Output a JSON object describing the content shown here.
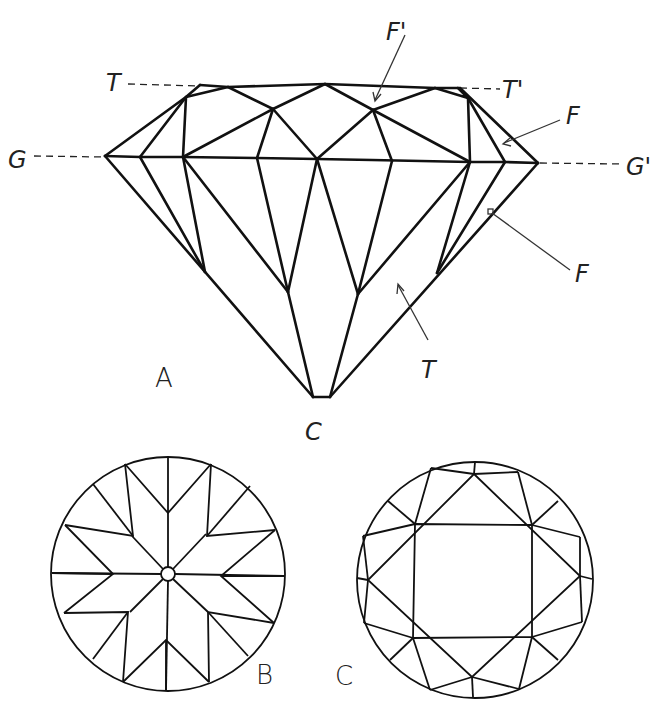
{
  "figure": {
    "side_view": {
      "panel_label": "A",
      "culet_label": "C",
      "labels": {
        "table_left": "T",
        "table_right": "T'",
        "girdle_left": "G",
        "girdle_right": "G'",
        "crown_facet_top": "F'",
        "crown_facet_side": "F",
        "pavilion_facet": "F",
        "pavilion_main": "T"
      }
    },
    "crown_top_view": {
      "panel_label": "B",
      "description": "Pavilion view with star pattern around central culet"
    },
    "table_top_view": {
      "panel_label": "C",
      "description": "Crown view with octagonal table and star/kite facets"
    },
    "colors": {
      "line": "#111111",
      "background": "#ffffff"
    }
  }
}
